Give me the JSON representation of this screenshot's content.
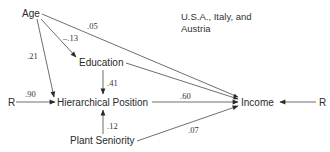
{
  "diagram": {
    "type": "path-diagram",
    "caption_line1": "U.S.A., Italy, and",
    "caption_line2": "Austria",
    "nodes": {
      "age": "Age",
      "education": "Education",
      "hierarchical_position": "Hierarchical Position",
      "plant_seniority": "Plant Seniority",
      "income": "Income",
      "residual_left": "R",
      "residual_right": "R"
    },
    "coefficients": {
      "age_to_income": ".05",
      "age_to_education": "–.13",
      "age_to_hierarchical_position": ".21",
      "education_to_hierarchical_position": ".41",
      "residual_to_hierarchical_position": ".90",
      "hierarchical_position_to_income": ".60",
      "plant_seniority_to_hierarchical_position": ".12",
      "plant_seniority_to_income": ".07"
    },
    "edges": [
      {
        "from": "Age",
        "to": "Income",
        "label": ".05"
      },
      {
        "from": "Age",
        "to": "Education",
        "label": "–.13"
      },
      {
        "from": "Age",
        "to": "Hierarchical Position",
        "label": ".21"
      },
      {
        "from": "Education",
        "to": "Hierarchical Position",
        "label": ".41"
      },
      {
        "from": "Education",
        "to": "Income",
        "label": ""
      },
      {
        "from": "R",
        "to": "Hierarchical Position",
        "label": ".90"
      },
      {
        "from": "Hierarchical Position",
        "to": "Income",
        "label": ".60"
      },
      {
        "from": "Plant Seniority",
        "to": "Hierarchical Position",
        "label": ".12"
      },
      {
        "from": "Plant Seniority",
        "to": "Income",
        "label": ".07"
      },
      {
        "from": "R",
        "to": "Income",
        "label": ""
      }
    ],
    "colors": {
      "line": "#3a3a3a",
      "text": "#2a2a2a",
      "background": "#ffffff"
    }
  }
}
